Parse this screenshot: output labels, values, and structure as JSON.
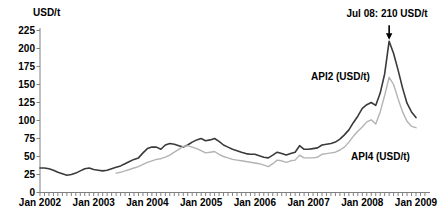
{
  "chart_data": {
    "type": "line",
    "title": "USD/t",
    "ylabel": "USD/t",
    "xlabel": "",
    "grid": false,
    "legend_position": "inline-labels",
    "ylim": [
      0,
      225
    ],
    "y_ticks": [
      0,
      25,
      50,
      75,
      100,
      125,
      150,
      175,
      200,
      225
    ],
    "x_tick_labels": [
      "Jan 2002",
      "Jan 2003",
      "Jan 2004",
      "Jan 2005",
      "Jan 2006",
      "Jan 2007",
      "Jan 2008",
      "Jan 2009"
    ],
    "x_unit": "month",
    "months_span": 84,
    "axis_color": "#808080",
    "series": [
      {
        "name": "API2 (USD/t)",
        "color": "#3a3a3a",
        "start_month_index": 0,
        "start_month": "Jan 2002",
        "values": [
          34,
          34,
          33,
          31,
          28,
          26,
          24,
          25,
          27,
          30,
          33,
          34,
          32,
          31,
          30,
          31,
          33,
          35,
          37,
          40,
          43,
          46,
          48,
          55,
          61,
          63,
          63,
          60,
          66,
          68,
          67,
          65,
          63,
          66,
          70,
          73,
          75,
          72,
          73,
          75,
          71,
          66,
          63,
          60,
          58,
          56,
          54,
          53,
          53,
          51,
          49,
          48,
          52,
          56,
          54,
          52,
          54,
          56,
          65,
          60,
          60,
          61,
          62,
          66,
          67,
          68,
          70,
          74,
          80,
          87,
          97,
          106,
          117,
          122,
          125,
          121,
          138,
          165,
          210,
          193,
          170,
          145,
          124,
          112,
          104
        ]
      },
      {
        "name": "API4 (USD/t)",
        "color": "#b3b3b3",
        "start_month_index": 17,
        "start_month": "Jun 2003",
        "values": [
          27,
          28,
          30,
          32,
          34,
          36,
          39,
          42,
          44,
          46,
          47,
          49,
          52,
          56,
          60,
          64,
          65,
          63,
          61,
          58,
          55,
          56,
          57,
          53,
          50,
          48,
          46,
          45,
          44,
          43,
          42,
          41,
          40,
          38,
          36,
          40,
          45,
          44,
          42,
          44,
          45,
          52,
          48,
          48,
          48,
          49,
          53,
          54,
          55,
          56,
          59,
          63,
          70,
          78,
          85,
          91,
          98,
          101,
          95,
          112,
          135,
          160,
          150,
          130,
          112,
          99,
          92,
          90
        ]
      }
    ],
    "annotation": {
      "label": "Jul 08: 210 USD/t",
      "month": "Jul 2008",
      "month_index": 78,
      "value": 210
    }
  }
}
